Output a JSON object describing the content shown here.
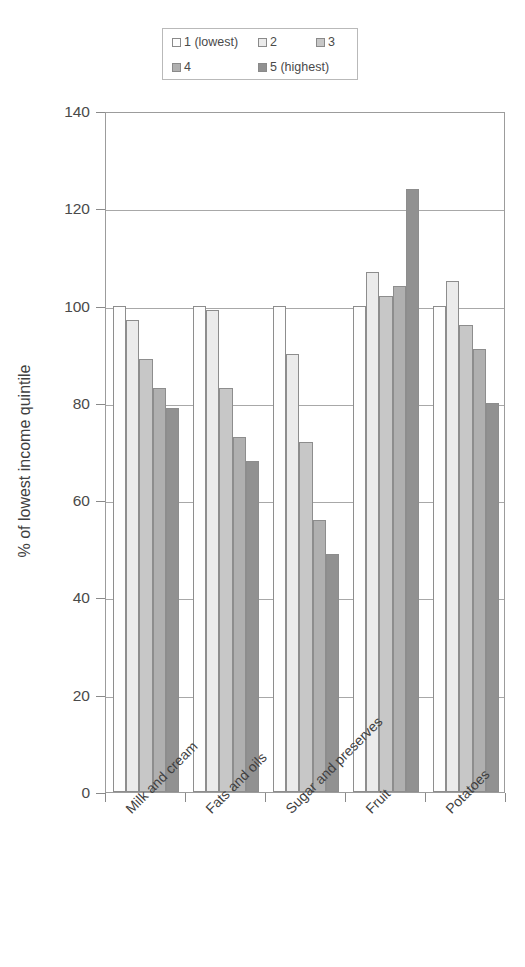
{
  "chart_data": {
    "type": "bar",
    "title": "",
    "xlabel": "",
    "ylabel": "% of lowest income quintile",
    "ylim": [
      0,
      140
    ],
    "ytick_step": 20,
    "yticks": [
      0,
      20,
      40,
      60,
      80,
      100,
      120,
      140
    ],
    "grid": true,
    "legend_position": "top",
    "categories": [
      "Milk and cream",
      "Fats and oils",
      "Sugar and preserves",
      "Fruit",
      "Potatoes"
    ],
    "series": [
      {
        "name": "1 (lowest)",
        "color": "#fdfdfd",
        "values": [
          100,
          100,
          100,
          100,
          100
        ]
      },
      {
        "name": "2",
        "color": "#ebebeb",
        "values": [
          97,
          99,
          90,
          107,
          105
        ]
      },
      {
        "name": "3",
        "color": "#c7c7c7",
        "values": [
          89,
          83,
          72,
          102,
          96
        ]
      },
      {
        "name": "4",
        "color": "#b0b0b0",
        "values": [
          83,
          73,
          56,
          104,
          91
        ]
      },
      {
        "name": "5 (highest)",
        "color": "#919191",
        "values": [
          79,
          68,
          49,
          124,
          80
        ]
      }
    ]
  },
  "legend": {
    "entries": [
      {
        "label": "1 (lowest)",
        "swatch": "#fdfdfd"
      },
      {
        "label": "2",
        "swatch": "#ebebeb"
      },
      {
        "label": "3",
        "swatch": "#c7c7c7"
      },
      {
        "label": "4",
        "swatch": "#b0b0b0"
      },
      {
        "label": "5 (highest)",
        "swatch": "#919191"
      }
    ]
  },
  "axes": {
    "y_title": "% of lowest income quintile",
    "y_tick_labels": [
      "140",
      "120",
      "100",
      "80",
      "60",
      "40",
      "20",
      "0"
    ]
  }
}
